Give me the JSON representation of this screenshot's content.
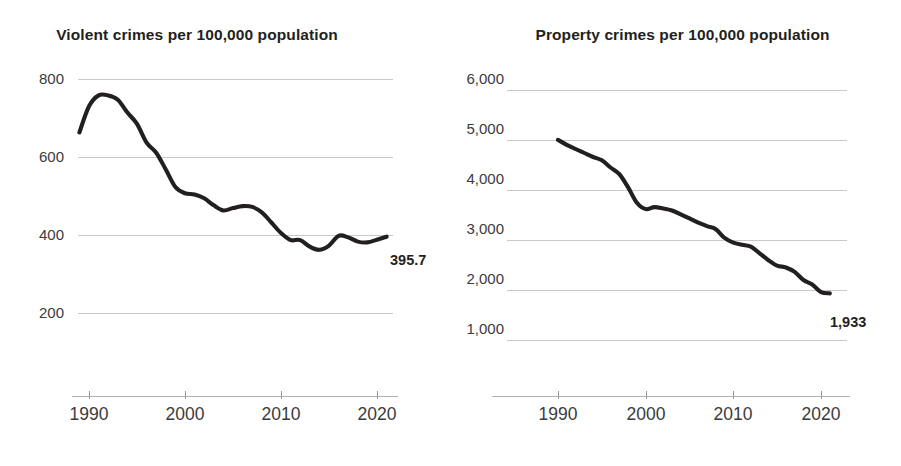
{
  "figure": {
    "background": "#ffffff",
    "line_color": "#231f20",
    "grid_color": "#c9c9c9"
  },
  "panels": [
    {
      "name": "violent-crimes",
      "title": "Violent crimes per 100,000 population",
      "endpoint_label": "395.7"
    },
    {
      "name": "property-crimes",
      "title": "Property crimes per 100,000 population",
      "endpoint_label": "1,933"
    }
  ],
  "chart_data": [
    {
      "type": "line",
      "title": "Violent crimes per 100,000 population",
      "xlabel": "",
      "ylabel": "",
      "xlim": [
        1989,
        2021
      ],
      "ylim": [
        180,
        820
      ],
      "yticks": [
        200,
        400,
        600,
        800
      ],
      "ytick_labels": [
        "200",
        "400",
        "600",
        "800"
      ],
      "xticks": [
        1990,
        2000,
        2010,
        2020
      ],
      "xtick_labels": [
        "1990",
        "2000",
        "2010",
        "2020"
      ],
      "grid": true,
      "legend": "none",
      "annotations": [
        {
          "text": "395.7",
          "x": 2021,
          "y": 395.7
        }
      ],
      "series": [
        {
          "name": "Violent crime rate",
          "x": [
            1989,
            1990,
            1991,
            1992,
            1993,
            1994,
            1995,
            1996,
            1997,
            1998,
            1999,
            2000,
            2001,
            2002,
            2003,
            2004,
            2005,
            2006,
            2007,
            2008,
            2009,
            2010,
            2011,
            2012,
            2013,
            2014,
            2015,
            2016,
            2017,
            2018,
            2019,
            2020,
            2021
          ],
          "values": [
            663,
            730,
            758,
            758,
            747,
            714,
            685,
            637,
            611,
            568,
            523,
            507,
            504,
            494,
            476,
            463,
            469,
            474,
            472,
            458,
            432,
            405,
            387,
            387,
            370,
            362,
            373,
            398,
            394,
            383,
            381,
            388,
            395.7
          ]
        }
      ]
    },
    {
      "type": "line",
      "title": "Property crimes per 100,000 population",
      "xlabel": "",
      "ylabel": "",
      "xlim": [
        1990,
        2021
      ],
      "ylim": [
        900,
        6200
      ],
      "yticks": [
        1000,
        2000,
        3000,
        4000,
        5000,
        6000
      ],
      "ytick_labels": [
        "1,000",
        "2,000",
        "3,000",
        "4,000",
        "5,000",
        "6,000"
      ],
      "xticks": [
        1990,
        2000,
        2010,
        2020
      ],
      "xtick_labels": [
        "1990",
        "2000",
        "2010",
        "2020"
      ],
      "grid": true,
      "legend": "none",
      "annotations": [
        {
          "text": "1,933",
          "x": 2021,
          "y": 1933
        }
      ],
      "series": [
        {
          "name": "Property crime rate",
          "x": [
            1990,
            1991,
            1992,
            1993,
            1994,
            1995,
            1996,
            1997,
            1998,
            1999,
            2000,
            2001,
            2002,
            2003,
            2004,
            2005,
            2006,
            2007,
            2008,
            2009,
            2010,
            2011,
            2012,
            2013,
            2014,
            2015,
            2016,
            2017,
            2018,
            2019,
            2020,
            2021
          ],
          "values": [
            5003,
            4903,
            4820,
            4740,
            4660,
            4595,
            4450,
            4316,
            4052,
            3744,
            3618,
            3658,
            3631,
            3591,
            3514,
            3432,
            3346,
            3276,
            3215,
            3041,
            2946,
            2905,
            2868,
            2734,
            2596,
            2487,
            2451,
            2362,
            2200,
            2110,
            1958,
            1933
          ]
        }
      ]
    }
  ]
}
